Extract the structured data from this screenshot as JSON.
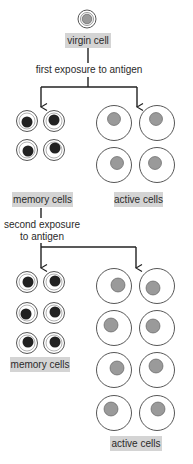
{
  "diagram": {
    "title": "",
    "labels": {
      "virgin_cell": "virgin cell",
      "first_exposure": "first exposure to antigen",
      "memory_cells_1": "memory cells",
      "active_cells_1": "active cells",
      "second_exposure_line1": "second exposure",
      "second_exposure_line2": "to antigen",
      "memory_cells_2": "memory cells",
      "active_cells_2": "active cells"
    },
    "counts": {
      "virgin_cells": 1,
      "memory_cells_after_first_exposure": 4,
      "active_cells_after_first_exposure": 4,
      "memory_cells_after_second_exposure": 6,
      "active_cells_after_second_exposure": 8
    },
    "colors": {
      "label_background": "#d4d4d4",
      "memory_nucleus": "#222222",
      "active_nucleus": "#9a9a9a",
      "outline": "#333333"
    }
  }
}
